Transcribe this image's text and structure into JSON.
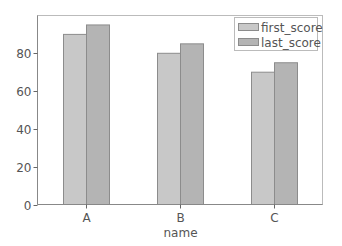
{
  "chart_data": {
    "type": "bar",
    "title": "",
    "xlabel": "name",
    "ylabel": "",
    "categories": [
      "A",
      "B",
      "C"
    ],
    "series": [
      {
        "name": "first_score",
        "values": [
          90,
          80,
          70
        ],
        "color": "#c8c8c8"
      },
      {
        "name": "last_score",
        "values": [
          95,
          85,
          75
        ],
        "color": "#b4b4b4"
      }
    ],
    "yticks": [
      0,
      20,
      40,
      60,
      80
    ],
    "ylim": [
      0,
      100
    ],
    "grid": false,
    "legend_position": "upper right"
  }
}
